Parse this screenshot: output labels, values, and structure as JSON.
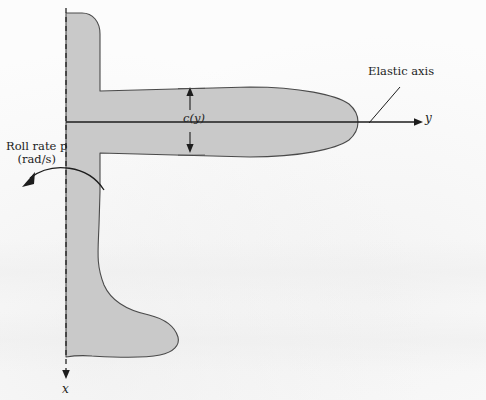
{
  "figure": {
    "background_color": "#fcfcfc",
    "wing_fill_color": "#c9c9c9",
    "line_color": "#2b2b2b"
  },
  "labels": {
    "elastic_axis": "Elastic axis",
    "roll_rate_line1": "Roll rate p",
    "roll_rate_line2": "(rad/s)",
    "chord": "c(y)",
    "y_axis": "y",
    "x_axis": "x"
  },
  "axes": {
    "y_axis": {
      "name": "y",
      "direction": "right",
      "style": "solid",
      "origin_px": [
        66,
        122
      ],
      "end_px": [
        420,
        122
      ]
    },
    "x_axis": {
      "name": "x",
      "direction": "down",
      "style": "dashed",
      "origin_px": [
        66,
        8
      ],
      "end_px": [
        66,
        378
      ]
    }
  },
  "annotations": {
    "chord_dimension": {
      "label": "c(y)",
      "type": "double-headed-arrow",
      "x_px": 190,
      "top_px": 88,
      "bottom_px": 152
    },
    "roll_arrow": {
      "label": "Roll rate p (rad/s)",
      "type": "curved-arrow",
      "direction": "counter-clockwise"
    },
    "elastic_axis_leader": {
      "type": "leader-line",
      "from_px": [
        400,
        88
      ],
      "to_px": [
        369,
        123
      ]
    }
  }
}
